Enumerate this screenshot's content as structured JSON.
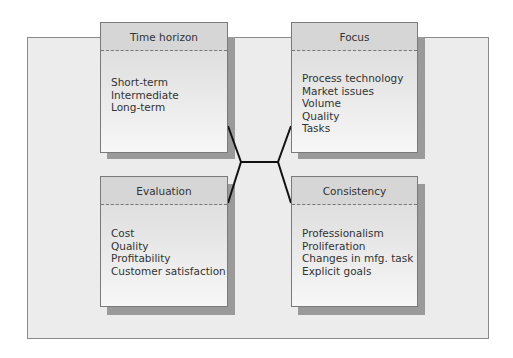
{
  "diagram": {
    "boxes": [
      {
        "id": "time-horizon",
        "title": "Time horizon",
        "items": [
          "Short-term",
          "Intermediate",
          "Long-term"
        ]
      },
      {
        "id": "focus",
        "title": "Focus",
        "items": [
          "Process technology",
          "Market issues",
          "Volume",
          "Quality",
          "Tasks"
        ]
      },
      {
        "id": "evaluation",
        "title": "Evaluation",
        "items": [
          "Cost",
          "Quality",
          "Profitability",
          "Customer satisfaction"
        ]
      },
      {
        "id": "consistency",
        "title": "Consistency",
        "items": [
          "Professionalism",
          "Proliferation",
          "Changes in mfg. task",
          "Explicit goals"
        ]
      }
    ],
    "colors": {
      "panel": "#ececec",
      "shadow": "#9a9a9a",
      "connector": "#111111"
    }
  }
}
